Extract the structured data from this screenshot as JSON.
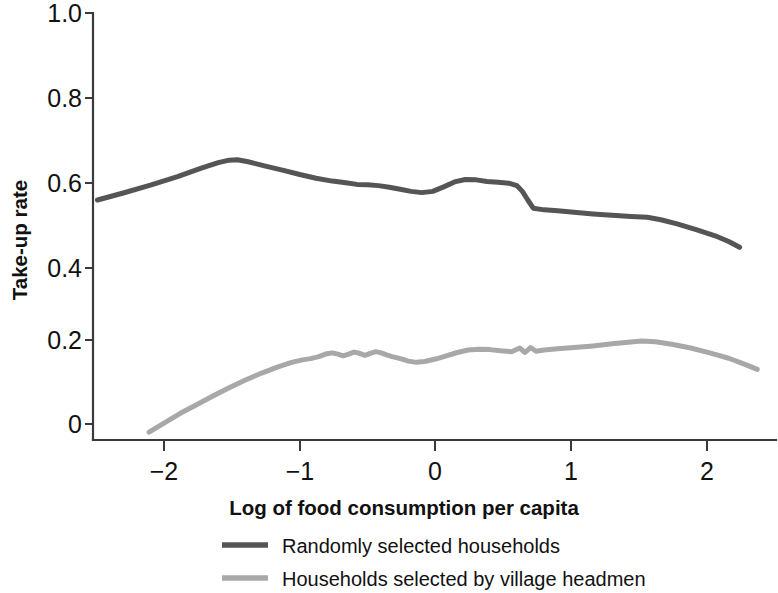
{
  "chart_data": {
    "type": "line",
    "title": "",
    "xlabel": "Log of food consumption per capita",
    "ylabel": "Take-up rate",
    "xlim": [
      -2.55,
      2.45
    ],
    "ylim": [
      -0.04,
      1.0
    ],
    "grid": false,
    "legend_position": "bottom-center",
    "xticks": [
      -2,
      -1,
      0,
      1,
      2
    ],
    "xtick_labels": [
      "−2",
      "−1",
      "0",
      "1",
      "2"
    ],
    "yticks": [
      0,
      0.2,
      0.4,
      0.6,
      0.8,
      1.0
    ],
    "ytick_labels": [
      "0",
      "0.2",
      "0.4",
      "0.6",
      "0.8",
      "1.0"
    ],
    "series": [
      {
        "name": "Randomly selected households",
        "color": "#555555",
        "stroke_width": 5.0,
        "x": [
          -2.49,
          -2.3,
          -2.1,
          -1.9,
          -1.72,
          -1.6,
          -1.52,
          -1.46,
          -1.38,
          -1.26,
          -1.12,
          -1.0,
          -0.88,
          -0.76,
          -0.66,
          -0.58,
          -0.5,
          -0.42,
          -0.34,
          -0.26,
          -0.18,
          -0.1,
          -0.02,
          0.06,
          0.14,
          0.22,
          0.3,
          0.38,
          0.46,
          0.54,
          0.6,
          0.64,
          0.68,
          0.72,
          0.8,
          0.9,
          1.02,
          1.16,
          1.3,
          1.44,
          1.56,
          1.66,
          1.78,
          1.92,
          2.06,
          2.16,
          2.24
        ],
        "y": [
          0.545,
          0.562,
          0.581,
          0.602,
          0.623,
          0.636,
          0.642,
          0.643,
          0.638,
          0.628,
          0.617,
          0.607,
          0.598,
          0.591,
          0.587,
          0.583,
          0.582,
          0.58,
          0.576,
          0.571,
          0.566,
          0.563,
          0.566,
          0.577,
          0.589,
          0.595,
          0.594,
          0.59,
          0.588,
          0.586,
          0.58,
          0.566,
          0.545,
          0.525,
          0.521,
          0.519,
          0.515,
          0.511,
          0.508,
          0.505,
          0.503,
          0.497,
          0.487,
          0.473,
          0.458,
          0.444,
          0.43
        ]
      },
      {
        "name": "Households selected by village headmen",
        "color": "#a8a8a8",
        "stroke_width": 5.0,
        "x": [
          -2.11,
          -2.0,
          -1.88,
          -1.76,
          -1.64,
          -1.52,
          -1.4,
          -1.28,
          -1.16,
          -1.06,
          -0.98,
          -0.92,
          -0.86,
          -0.8,
          -0.76,
          -0.72,
          -0.68,
          -0.64,
          -0.6,
          -0.56,
          -0.52,
          -0.48,
          -0.44,
          -0.4,
          -0.36,
          -0.32,
          -0.28,
          -0.24,
          -0.2,
          -0.14,
          -0.08,
          0.0,
          0.08,
          0.16,
          0.24,
          0.32,
          0.4,
          0.48,
          0.56,
          0.62,
          0.66,
          0.7,
          0.74,
          0.8,
          0.9,
          1.02,
          1.16,
          1.3,
          1.42,
          1.52,
          1.62,
          1.74,
          1.88,
          2.02,
          2.16,
          2.28,
          2.37
        ],
        "y": [
          -0.02,
          0.002,
          0.026,
          0.047,
          0.068,
          0.088,
          0.107,
          0.124,
          0.139,
          0.15,
          0.156,
          0.159,
          0.164,
          0.171,
          0.173,
          0.17,
          0.166,
          0.17,
          0.175,
          0.172,
          0.167,
          0.172,
          0.176,
          0.173,
          0.168,
          0.164,
          0.161,
          0.157,
          0.153,
          0.15,
          0.152,
          0.158,
          0.166,
          0.174,
          0.18,
          0.182,
          0.181,
          0.178,
          0.176,
          0.185,
          0.174,
          0.186,
          0.177,
          0.18,
          0.183,
          0.186,
          0.19,
          0.195,
          0.199,
          0.202,
          0.2,
          0.194,
          0.185,
          0.173,
          0.16,
          0.145,
          0.133
        ]
      }
    ]
  },
  "legend": {
    "items": [
      {
        "label": "Randomly selected households",
        "color": "#555555"
      },
      {
        "label": "Households selected by village headmen",
        "color": "#a8a8a8"
      }
    ]
  },
  "axes": {
    "y_title": "Take-up rate",
    "x_title": "Log of food consumption per capita",
    "y_labels": [
      "1.0",
      "0.8",
      "0.6",
      "0.4",
      "0.2",
      "0"
    ],
    "x_labels": [
      "−2",
      "−1",
      "0",
      "1",
      "2"
    ]
  }
}
